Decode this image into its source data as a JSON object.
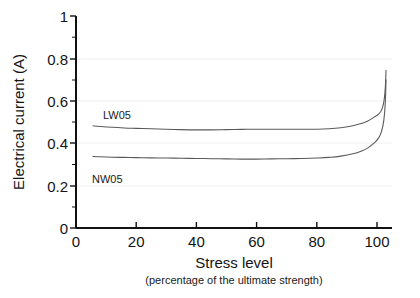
{
  "chart_data": {
    "type": "line",
    "title": "",
    "xlabel": "Stress level",
    "xlabel_sub": "(percentage of the ultimate strength)",
    "ylabel": "Electrical current (A)",
    "xlim": [
      0,
      105
    ],
    "ylim": [
      0,
      1
    ],
    "xticks": [
      0,
      20,
      40,
      60,
      80,
      100
    ],
    "xtick_labels": [
      "0",
      "20",
      "40",
      "60",
      "80",
      "100"
    ],
    "yticks": [
      0,
      0.2,
      0.4,
      0.6,
      0.8,
      1
    ],
    "ytick_labels": [
      "0",
      "0.2",
      "0.4",
      "0.6",
      "0.8",
      "1"
    ],
    "minor_tick_step_y": 0.1,
    "grid": {
      "horizontal": true,
      "values": [
        0.2,
        0.4,
        0.6,
        0.8
      ],
      "color": "#eeeeee"
    },
    "legend_position": "inline-annotations",
    "line_color": "#5a5a5a",
    "axis_color": "#111111",
    "series": [
      {
        "name": "LW05",
        "label_value": "LW05",
        "x": [
          5.5,
          8,
          12,
          16,
          20,
          25,
          30,
          35,
          40,
          45,
          50,
          55,
          60,
          65,
          70,
          75,
          80,
          84,
          88,
          92,
          95,
          97,
          99,
          100.5,
          101.5,
          102.3,
          102.8,
          103
        ],
        "y": [
          0.482,
          0.479,
          0.475,
          0.472,
          0.47,
          0.468,
          0.466,
          0.464,
          0.463,
          0.463,
          0.464,
          0.465,
          0.466,
          0.466,
          0.466,
          0.466,
          0.466,
          0.468,
          0.473,
          0.482,
          0.494,
          0.505,
          0.522,
          0.537,
          0.556,
          0.596,
          0.668,
          0.745
        ]
      },
      {
        "name": "NW05",
        "label_value": "NW05",
        "x": [
          5.5,
          8,
          12,
          16,
          20,
          25,
          30,
          35,
          40,
          45,
          50,
          55,
          60,
          65,
          70,
          75,
          80,
          84,
          88,
          92,
          95,
          97,
          99,
          100.5,
          101.5,
          102.3,
          102.8,
          103
        ],
        "y": [
          0.338,
          0.336,
          0.334,
          0.333,
          0.332,
          0.331,
          0.33,
          0.329,
          0.328,
          0.327,
          0.326,
          0.325,
          0.325,
          0.326,
          0.327,
          0.328,
          0.33,
          0.333,
          0.339,
          0.35,
          0.364,
          0.378,
          0.4,
          0.424,
          0.455,
          0.51,
          0.6,
          0.7
        ]
      }
    ],
    "annotations": [
      {
        "text": "LW05",
        "x_px": 103,
        "y_px": 119
      },
      {
        "text": "NW05",
        "x_px": 92,
        "y_px": 183
      }
    ]
  }
}
